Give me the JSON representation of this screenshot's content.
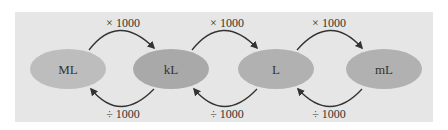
{
  "diagram": {
    "colors": {
      "background": "#e6e6e6",
      "ellipse_light": "#bdbdbd",
      "ellipse_dark": "#a9a9a9",
      "arrow": "#333333",
      "text": "#333333"
    },
    "units": [
      {
        "label": "ML"
      },
      {
        "label": "kL"
      },
      {
        "label": "L"
      },
      {
        "label": "mL"
      }
    ],
    "forward_ops": [
      {
        "label": "× 1000"
      },
      {
        "label": "× 1000"
      },
      {
        "label": "× 1000"
      }
    ],
    "backward_ops": [
      {
        "label": "÷ 1000"
      },
      {
        "label": "÷ 1000"
      },
      {
        "label": "÷ 1000"
      }
    ]
  }
}
